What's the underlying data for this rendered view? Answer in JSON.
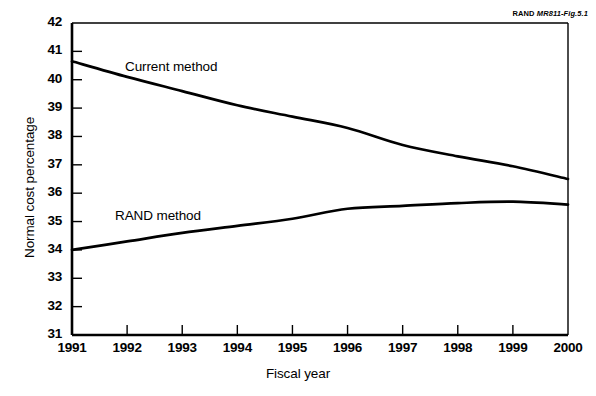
{
  "figure": {
    "source_note_prefix": "RAND ",
    "source_note_id": "MR811-Fig.5.1"
  },
  "chart_data": {
    "type": "line",
    "title": "",
    "xlabel": "Fiscal year",
    "ylabel": "Normal cost percentage",
    "xlim": [
      1991,
      2000
    ],
    "ylim": [
      31,
      42
    ],
    "grid": false,
    "legend_position": "inline-annotation",
    "line_color": "#000000",
    "x": [
      1991,
      1992,
      1993,
      1994,
      1995,
      1996,
      1997,
      1998,
      1999,
      2000
    ],
    "xtick_labels": [
      "1991",
      "1992",
      "1993",
      "1994",
      "1995",
      "1996",
      "1997",
      "1998",
      "1999",
      "2000"
    ],
    "ytick_labels": [
      "42",
      "41",
      "40",
      "39",
      "38",
      "37",
      "36",
      "35",
      "34",
      "33",
      "32",
      "31"
    ],
    "yticks": [
      42,
      41,
      40,
      39,
      38,
      37,
      36,
      35,
      34,
      33,
      32,
      31
    ],
    "series": [
      {
        "name": "Current method",
        "label": "Current method",
        "values": [
          40.65,
          40.1,
          39.6,
          39.1,
          38.7,
          38.3,
          37.7,
          37.3,
          36.95,
          36.5
        ]
      },
      {
        "name": "RAND method",
        "label": "RAND method",
        "values": [
          34.0,
          34.3,
          34.6,
          34.85,
          35.1,
          35.45,
          35.55,
          35.65,
          35.7,
          35.6
        ]
      }
    ]
  }
}
